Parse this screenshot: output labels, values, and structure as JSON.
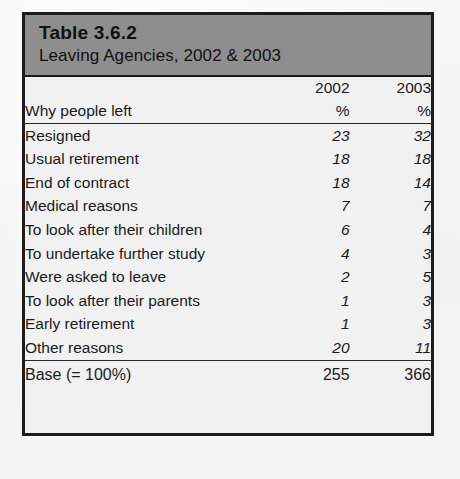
{
  "document": {
    "table": {
      "title": "Table 3.6.2",
      "subtitle": "Leaving Agencies, 2002 & 2003",
      "header": {
        "row_label_header": "Why people left",
        "years": [
          "2002",
          "2003"
        ],
        "units": [
          "%",
          "%"
        ]
      },
      "rows": [
        {
          "label": "Resigned",
          "v2002": "23",
          "v2003": "32"
        },
        {
          "label": "Usual retirement",
          "v2002": "18",
          "v2003": "18"
        },
        {
          "label": "End of contract",
          "v2002": "18",
          "v2003": "14"
        },
        {
          "label": "Medical reasons",
          "v2002": "7",
          "v2003": "7"
        },
        {
          "label": "To look after their children",
          "v2002": "6",
          "v2003": "4"
        },
        {
          "label": "To undertake further study",
          "v2002": "4",
          "v2003": "3"
        },
        {
          "label": "Were asked to leave",
          "v2002": "2",
          "v2003": "5"
        },
        {
          "label": "To look after their parents",
          "v2002": "1",
          "v2003": "3"
        },
        {
          "label": "Early retirement",
          "v2002": "1",
          "v2003": "3"
        },
        {
          "label": "Other reasons",
          "v2002": "20",
          "v2003": "11"
        }
      ],
      "base": {
        "label": "Base (= 100%)",
        "v2002": "255",
        "v2003": "366"
      }
    }
  },
  "chart_data": {
    "type": "table",
    "columns": [
      "Why people left",
      "2002 %",
      "2003 %"
    ],
    "categories": [
      "Resigned",
      "Usual retirement",
      "End of contract",
      "Medical reasons",
      "To look after their children",
      "To undertake further study",
      "Were asked to leave",
      "To look after their parents",
      "Early retirement",
      "Other reasons"
    ],
    "series": [
      {
        "name": "2002",
        "values": [
          23,
          18,
          18,
          7,
          6,
          4,
          2,
          1,
          1,
          20
        ],
        "base": 255
      },
      {
        "name": "2003",
        "values": [
          32,
          18,
          14,
          7,
          4,
          3,
          5,
          3,
          3,
          11
        ],
        "base": 366
      }
    ],
    "units": "percent"
  }
}
